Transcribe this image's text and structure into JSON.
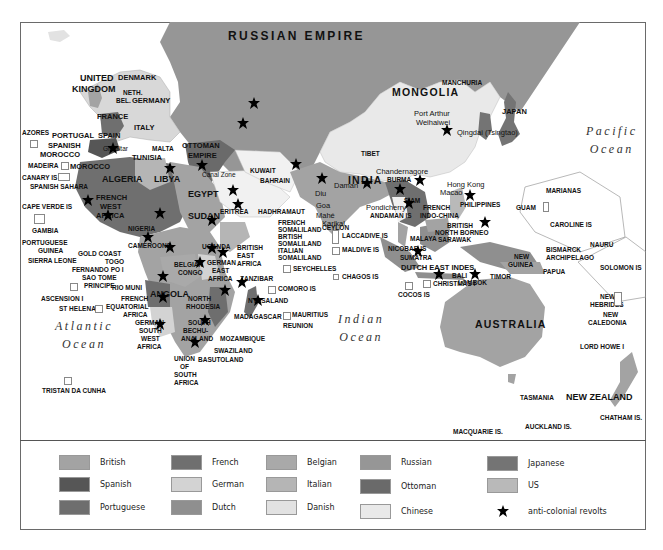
{
  "map": {
    "title_regions": {
      "russian_empire": "RUSSIAN EMPIRE",
      "australia": "AUSTRALIA",
      "new_zealand": "NEW ZEALAND",
      "india": "INDIA",
      "mongolia": "MONGOLIA"
    },
    "oceans": {
      "pacific": [
        "Pacific",
        "Ocean"
      ],
      "indian": [
        "Indian",
        "Ocean"
      ],
      "atlantic": [
        "Atlantic",
        "Ocean"
      ]
    },
    "labels": {
      "iceland": "ICELAND",
      "uk1": "UNITED",
      "uk2": "KINGDOM",
      "denmark": "DENMARK",
      "neth": "NETH.",
      "bel": "BEL.",
      "germany": "GERMANY",
      "france": "FRANCE",
      "italy": "ITALY",
      "azores": "AZORES",
      "portugal": "PORTUGAL",
      "spain": "SPAIN",
      "spanish_morocco1": "SPANISH",
      "spanish_morocco2": "MOROCCO",
      "gibraltar": "Gibraltar",
      "malta": "MALTA",
      "tunisia": "TUNISIA",
      "madeira": "MADEIRA",
      "morocco": "MOROCCO",
      "canary": "CANARY IS",
      "spanish_sahara": "SPANISH SAHARA",
      "algeria": "ALGERIA",
      "libya": "LIBYA",
      "egypt": "EGYPT",
      "ottoman1": "OTTOMAN",
      "ottoman2": "EMPIRE",
      "canal_zone": "Canal Zone",
      "kuwait": "KUWAIT",
      "bahrain": "BAHRAIN",
      "cape_verde": "CAPE VERDE IS",
      "fwa1": "FRENCH",
      "fwa2": "WEST",
      "fwa3": "AFRICA",
      "sudan": "SUDAN",
      "eritrea": "ERITREA",
      "hadhramaut": "HADHRAMAUT",
      "gambia": "GAMBIA",
      "nigeria": "NIGERIA",
      "pg1": "PORTUGUESE",
      "pg2": "GUINEA",
      "gold_coast": "GOLD COAST",
      "togo": "TOGO",
      "sierra_leone": "SIERRA LEONE",
      "cameroons": "CAMEROONS",
      "fernando_po": "FERNANDO PO I",
      "sao_tome": "SAO TOME",
      "principe": "PRINCIPE",
      "rio_muni": "RIO MUNI",
      "ascension": "ASCENSION I",
      "fea1": "FRENCH",
      "fea2": "EQUATORIAL",
      "fea3": "AFRICA",
      "st_helena": "ST HELENA",
      "belgian1": "BELGIAN",
      "belgian2": "CONGO",
      "uganda": "UGANDA",
      "gea1": "GERMAN",
      "gea2": "EAST",
      "gea3": "AFRICA",
      "bea1": "BRITISH",
      "bea2": "EAST",
      "bea3": "AFRICA",
      "fsom1": "FRENCH",
      "fsom2": "SOMALILAND",
      "bsom1": "BRTISH",
      "bsom2": "SOMALILAND",
      "isom1": "ITALIAN",
      "isom2": "SOMALILAND",
      "seychelles": "SEYCHELLES",
      "chagos": "CHAGOS IS",
      "zanzibar": "ZANZIBAR",
      "comoro": "COMORO IS",
      "angola": "ANGOLA",
      "nrh1": "NORTH",
      "nrh2": "RHODESIA",
      "nyasaland": "NYASALAND",
      "madagascar": "MADAGASCAR",
      "mauritius": "MAURITIUS",
      "reunion": "REUNION",
      "gsw1": "GERMAN",
      "gsw2": "SOUTH",
      "gsw3": "WEST",
      "gsw4": "AFRICA",
      "bech1": "BECHU-",
      "bech2": "ANALAND",
      "south": "SOUTH",
      "mozambique": "MOZAMBIQUE",
      "swaziland": "SWAZILAND",
      "basutoland": "BASUTOLAND",
      "usa1": "UNION",
      "usa2": "OF",
      "usa3": "SOUTH",
      "usa4": "AFRICA",
      "tristan": "TRISTAN DA CUNHA",
      "tibet": "TIBET",
      "manchuria": "MANCHURIA",
      "port_arthur": "Port Arthur",
      "weihaiwei": "Weihaiwei",
      "qingdao": "Qingdai (Tsingtao)",
      "japan": "JAPAN",
      "chandernagore": "Chandernagore",
      "burma": "BURMA",
      "hong_kong": "Hong Kong",
      "macao": "Macao",
      "diu": "Diu",
      "daman": "Daman",
      "goa": "Goa",
      "mahe": "Mahé",
      "karikal": "Karikal",
      "pondicherry": "Pondicherry",
      "andaman": "ANDAMAN IS",
      "siam": "SIAM",
      "fic1": "FRENCH",
      "fic2": "INDO-CHINA",
      "philippines": "PHILIPPINES",
      "ceylon": "CEYLON",
      "laccadive": "LACCADIVE IS",
      "maldive": "MALDIVE IS",
      "nicobar": "NICOBAR IS",
      "malaya": "MALAYA",
      "bnb1": "BRITISH",
      "bnb2": "NORTH BORNEO",
      "sarawak": "SARAWAK",
      "sumatra": "SUMATRA",
      "dei": "DUTCH EAST INDES",
      "bali": "BALI",
      "lombok": "LOMBOK",
      "timor": "TIMOR",
      "cocos": "COCOS IS",
      "christmas": "CHRISTMAS I",
      "marianas": "MARIANAS",
      "guam": "GUAM",
      "caroline": "CAROLINE IS",
      "nauru": "NAURU",
      "bismarck1": "BISMARCK",
      "bismarck2": "ARCHIPELAGO",
      "ng1": "NEW",
      "ng2": "GUINEA",
      "papua": "PAPUA",
      "solomon": "SOLOMON IS",
      "nh1": "NEW",
      "nh2": "HEBRIDES",
      "nc1": "NEW",
      "nc2": "CALEDONIA",
      "lord_howe": "LORD HOWE I",
      "tasmania": "TASMANIA",
      "chatham": "CHATHAM IS.",
      "macquarie": "MACQUARIE IS.",
      "auckland": "AUCKLAND IS."
    }
  },
  "legend": {
    "items": [
      {
        "label": "British",
        "color": "#a3a3a3"
      },
      {
        "label": "Spanish",
        "color": "#565656"
      },
      {
        "label": "Portuguese",
        "color": "#6e6e6e"
      },
      {
        "label": "French",
        "color": "#6f6f6f"
      },
      {
        "label": "German",
        "color": "#d3d3d3"
      },
      {
        "label": "Dutch",
        "color": "#8f8f8f"
      },
      {
        "label": "Belgian",
        "color": "#a9a9a9"
      },
      {
        "label": "Italian",
        "color": "#b5b5b5"
      },
      {
        "label": "Danish",
        "color": "#e2e2e2"
      },
      {
        "label": "Russian",
        "color": "#969696"
      },
      {
        "label": "Ottoman",
        "color": "#6a6a6a"
      },
      {
        "label": "Chinese",
        "color": "#e9e9e9"
      },
      {
        "label": "Japanese",
        "color": "#747474"
      },
      {
        "label": "US",
        "color": "#b9b9b9"
      }
    ],
    "revolt_label": "anti-colonial revolts"
  }
}
